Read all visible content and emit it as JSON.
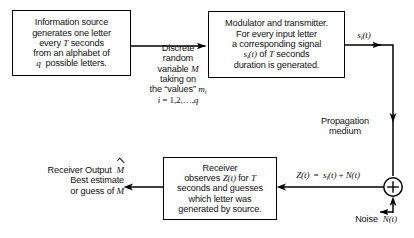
{
  "diagram": {
    "colors": {
      "background": "#ffffff",
      "stroke": "#000000",
      "text": "#111111"
    },
    "blocks": {
      "source": {
        "name": "information-source",
        "lines": [
          "Information source",
          "generates one letter",
          "every T seconds",
          "from an alphabet of",
          "q possible letters."
        ]
      },
      "modulator": {
        "name": "modulator-transmitter",
        "lines": [
          "Modulator and transmitter.",
          "For every input letter",
          "a corresponding signal",
          "sᵢ(t) of T seconds",
          "duration is generated."
        ]
      },
      "receiver": {
        "name": "receiver",
        "lines": [
          "Receiver",
          "observes Z(t) for T",
          "seconds and guesses",
          "which letter was",
          "generated by source."
        ]
      }
    },
    "labels": {
      "discrete_rv": [
        "Discrete",
        "random",
        "variable M",
        "taking on",
        "the “values” mᵢ",
        "i = 1,2,…,q"
      ],
      "transmitted_signal": "sᵢ(t)",
      "propagation": [
        "Propagation",
        "medium"
      ],
      "received_signal": "Z(t) = sᵢ(t) + N(t)",
      "noise": "Noise N(t)",
      "receiver_output": [
        "Receiver Output M̂",
        "Best estimate",
        "or guess of M"
      ]
    },
    "adder": {
      "name": "summing-junction",
      "symbol": "+"
    }
  }
}
